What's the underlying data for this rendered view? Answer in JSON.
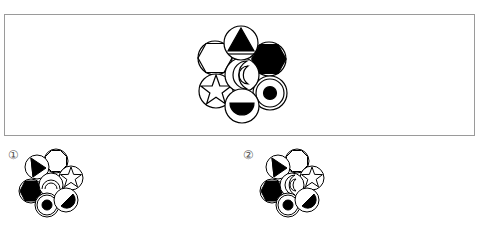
{
  "question": {
    "figure_name": "seven-circle-flower",
    "circles": [
      {
        "position": "top",
        "symbol": "filled-triangle-with-bar"
      },
      {
        "position": "upper-left",
        "symbol": "outline-hexagon"
      },
      {
        "position": "upper-right",
        "symbol": "filled-hexagon"
      },
      {
        "position": "center",
        "symbol": "double-crescent"
      },
      {
        "position": "lower-left",
        "symbol": "outline-star"
      },
      {
        "position": "lower-right",
        "symbol": "filled-dot-in-ring"
      },
      {
        "position": "bottom",
        "symbol": "filled-lower-half-disc"
      }
    ]
  },
  "options": [
    {
      "label": "①",
      "number": 1
    },
    {
      "label": "②",
      "number": 2
    }
  ],
  "colors": {
    "stroke": "#000000",
    "fill": "#000000",
    "frame": "#9a9a9a",
    "label": "#555555"
  }
}
